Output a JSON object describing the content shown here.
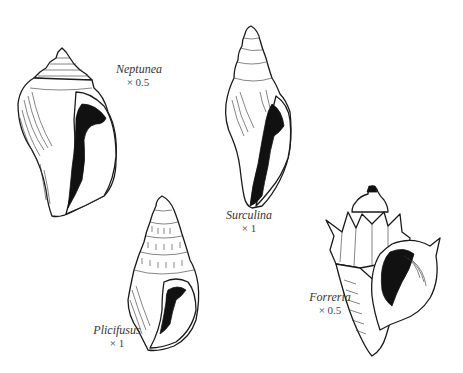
{
  "figure": {
    "background": "#ffffff",
    "ink_color": "#111111",
    "specimens": [
      {
        "id": "neptunea",
        "name": "Neptunea",
        "scale": "× 0.5"
      },
      {
        "id": "surculina",
        "name": "Surculina",
        "scale": "× 1"
      },
      {
        "id": "plicifusus",
        "name": "Plicifusus",
        "scale": "× 1"
      },
      {
        "id": "forreria",
        "name": "Forreria",
        "scale": "× 0.5"
      }
    ]
  }
}
